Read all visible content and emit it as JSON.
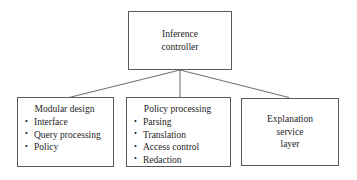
{
  "diagram": {
    "type": "hierarchy-tree",
    "background_color": "#ffffff",
    "line_color": "#5a5a5a",
    "text_color": "#1d1d1d",
    "root": {
      "id": "inference-controller",
      "lines": [
        "Inference",
        "controller"
      ]
    },
    "children": [
      {
        "id": "modular-design",
        "heading": "Modular design",
        "bullets": [
          "Interface",
          "Query processing",
          "Policy"
        ]
      },
      {
        "id": "policy-processing",
        "heading": "Policy processing",
        "bullets": [
          "Parsing",
          "Translation",
          "Access control",
          "Redaction"
        ]
      },
      {
        "id": "explanation-service-layer",
        "lines": [
          "Explanation",
          "service",
          "layer"
        ]
      }
    ],
    "connectors": [
      {
        "from": "inference-controller",
        "to": "modular-design"
      },
      {
        "from": "inference-controller",
        "to": "policy-processing"
      },
      {
        "from": "inference-controller",
        "to": "explanation-service-layer"
      }
    ]
  }
}
